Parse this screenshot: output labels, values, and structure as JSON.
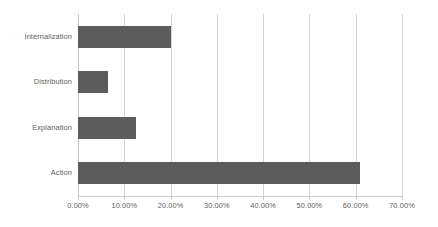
{
  "chart_data": {
    "type": "bar",
    "orientation": "horizontal",
    "title": "",
    "xlabel": "",
    "ylabel": "",
    "categories": [
      "Internalization",
      "Distribution",
      "Explanation",
      "Action"
    ],
    "values": [
      20.0,
      6.5,
      12.6,
      61.0
    ],
    "value_format": "percent",
    "xlim": [
      0,
      70
    ],
    "xticks": [
      0,
      10,
      20,
      30,
      40,
      50,
      60,
      70
    ],
    "xtick_labels": [
      "0.00%",
      "10.00%",
      "20.00%",
      "30.00%",
      "40.00%",
      "50.00%",
      "60.00%",
      "70.00%"
    ],
    "grid": true,
    "grid_axis": "x",
    "legend": false,
    "series": [
      {
        "name": "Series 1",
        "values": [
          20.0,
          6.5,
          12.6,
          61.0
        ]
      }
    ]
  },
  "style": {
    "background": "#ffffff",
    "bar_color": "#585858",
    "gridline_color": "#d7d7d7",
    "axis_color": "#c9c9c9",
    "label_color": "#5e5e5e"
  }
}
